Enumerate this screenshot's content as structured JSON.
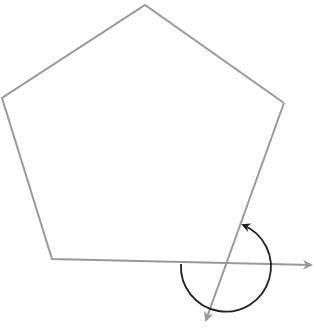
{
  "diagram": {
    "colors": {
      "polygon_stroke": "#999999",
      "arrow_stroke": "#999999",
      "arc_stroke": "#222222",
      "background": "#ffffff"
    },
    "pentagon": {
      "vertices": [
        [
          145,
          5
        ],
        [
          284,
          103
        ],
        [
          226,
          263
        ],
        [
          52,
          259
        ],
        [
          2,
          98
        ]
      ]
    },
    "extended_edge_arrow": {
      "from": [
        52,
        259
      ],
      "to": [
        313,
        265
      ]
    },
    "next_edge_arrow": {
      "from": [
        284,
        103
      ],
      "to": [
        205,
        322
      ]
    },
    "angle_arc": {
      "center": [
        226,
        263
      ],
      "radius": 45,
      "direction": "clockwise-from-left-around-bottom-to-edge"
    }
  }
}
